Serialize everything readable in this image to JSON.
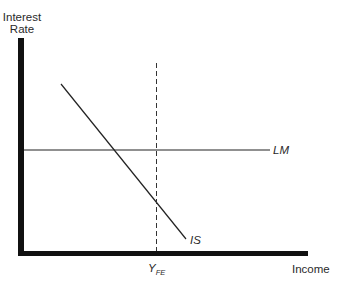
{
  "diagram": {
    "type": "IS-LM diagram",
    "y_axis": {
      "label_line1": "Interest",
      "label_line2": "Rate"
    },
    "x_axis": {
      "label": "Income"
    },
    "curves": {
      "lm": {
        "label": "LM",
        "shape": "horizontal line"
      },
      "is": {
        "label": "IS",
        "shape": "downward sloping line"
      }
    },
    "reference_line": {
      "label_main": "Y",
      "label_subscript": "FE",
      "style": "dashed vertical"
    },
    "colors": {
      "axis": "#111111",
      "lines": "#222222",
      "text": "#2a2a2a",
      "background": "#ffffff"
    }
  }
}
